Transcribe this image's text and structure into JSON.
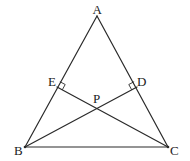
{
  "diagram": {
    "type": "triangle-with-altitudes",
    "colors": {
      "stroke": "#2a2a2a",
      "text": "#222222",
      "background": "#ffffff"
    },
    "points": {
      "A": {
        "label": "A",
        "x": 97,
        "y": 16
      },
      "B": {
        "label": "B",
        "x": 25,
        "y": 147
      },
      "C": {
        "label": "C",
        "x": 168,
        "y": 147
      },
      "E": {
        "label": "E",
        "x": 57,
        "y": 87
      },
      "D": {
        "label": "D",
        "x": 137,
        "y": 87
      },
      "P": {
        "label": "P",
        "x": 97,
        "y": 106
      }
    },
    "segments": [
      "AB",
      "AC",
      "BC",
      "BD",
      "CE"
    ],
    "right_angles": [
      "E",
      "D"
    ]
  }
}
